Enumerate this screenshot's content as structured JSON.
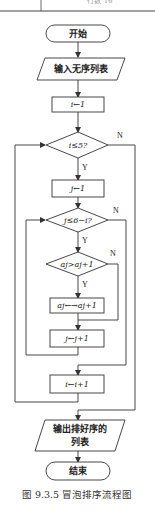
{
  "header_fragment": {
    "text": "行数 16"
  },
  "flowchart": {
    "start": "开始",
    "input": "输入无序列表",
    "init_i": "i←1",
    "cond_outer": "i≤5?",
    "init_j": "j←1",
    "cond_inner": "j≤6−i?",
    "cond_compare": "aj>aj+1",
    "swap": "aj←→aj+1",
    "inc_j": "j←j+1",
    "inc_i": "i←i+1",
    "output_line1": "输出排好序的",
    "output_line2": "列表",
    "end": "结束",
    "yes_label": "Y",
    "no_label": "N"
  },
  "caption": "图 9.3.5   冒泡排序流程图"
}
